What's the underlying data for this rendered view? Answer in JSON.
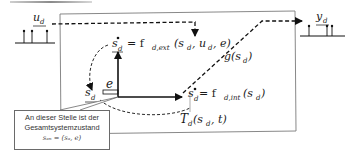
{
  "diagram": {
    "top_bar_color": "#9a9a9a",
    "input": {
      "label": "u",
      "subscript": "d"
    },
    "output": {
      "label": "y",
      "subscript": "d"
    },
    "equations": {
      "external_transition": {
        "lhs": "s",
        "lhs_sub": "d",
        "rhs": "= f",
        "rhs_sub": "d,ext",
        "args": "(s",
        "args_sub1": "d",
        "args_mid": ", u",
        "args_sub2": "d",
        "args_end": ", e)"
      },
      "internal_transition": {
        "lhs": "s",
        "lhs_sub": "d",
        "rhs": "= f",
        "rhs_sub": "d,int",
        "args": "(s",
        "args_sub": "d",
        "args_end": ")"
      },
      "output_function": {
        "name": "g",
        "args": "(s",
        "args_sub": "d",
        "args_end": ")"
      },
      "time_advance": {
        "name": "T",
        "name_sub": "d",
        "args": "(s",
        "args_sub": "d",
        "args_end": ", t)"
      },
      "elapsed_time": "e",
      "state": {
        "label": "s",
        "subscript": "d"
      }
    },
    "callout": {
      "line1": "An dieser Stelle ist der",
      "line2": "Gesamtsystemzustand",
      "formula": "sₐₙ = (sₐ, e)",
      "formula_display": "sₐₙ = (sₐ, e)"
    }
  }
}
